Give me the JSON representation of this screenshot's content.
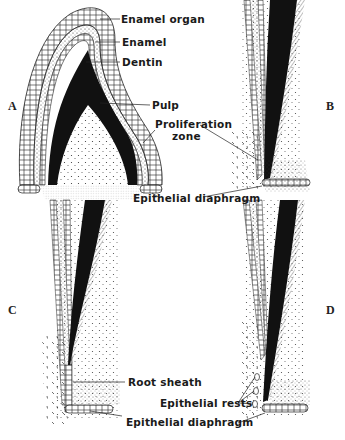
{
  "figure": {
    "panels": [
      {
        "letter": "A"
      },
      {
        "letter": "B"
      },
      {
        "letter": "C"
      },
      {
        "letter": "D"
      }
    ],
    "labels": {
      "enamel_organ": "Enamel organ",
      "enamel": "Enamel",
      "dentin": "Dentin",
      "pulp": "Pulp",
      "proliferation_line1": "Proliferation",
      "proliferation_line2": "zone",
      "epithelial_diaphragm_top": "Epithelial diaphragm",
      "root_sheath": "Root sheath",
      "epithelial_rests": "Epithelial rests",
      "epithelial_diaphragm_bottom": "Epithelial diaphragm"
    },
    "colors": {
      "ink": "#111111",
      "background": "#ffffff"
    }
  }
}
